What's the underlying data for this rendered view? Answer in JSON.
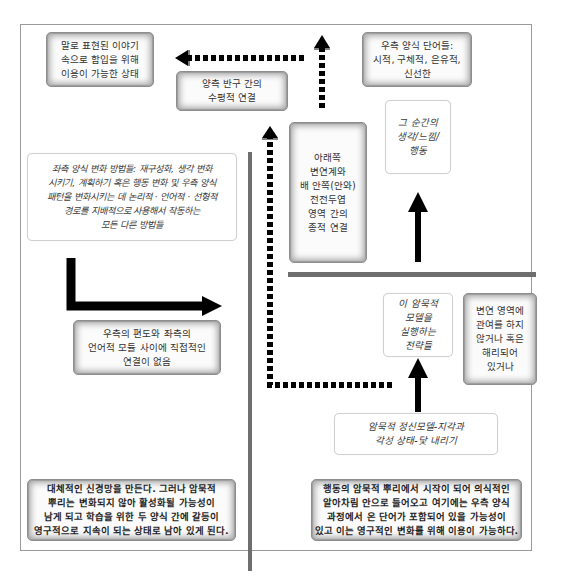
{
  "diagram": {
    "type": "brain-hemisphere-connection-diagram",
    "colors": {
      "frame_border": "#9a9a9a",
      "divider": "#6e6e6e",
      "arrow": "#000000",
      "shaded_box_edge": "#a8a8a8"
    },
    "boxes": {
      "verbal_story_state": {
        "text": "말로 표현된 이야기\n속으로 함입을 위해\n이용이 가능한 상태",
        "style": "shaded"
      },
      "horizontal_connection": {
        "text": "양측 반구 간의\n수평적 연결",
        "style": "shaded"
      },
      "right_mode_words": {
        "text": "우측 양식 단어들:\n시적, 구체적, 은유적,\n신선한",
        "style": "shaded"
      },
      "moment_thoughts": {
        "text": "그 순간의\n생각/느낌/\n행동",
        "style": "plain-italic"
      },
      "vertical_connection": {
        "text": "아래쪽\n변연계와\n배 안쪽(안와)\n전전두엽\n영역 간의\n종적 연결",
        "style": "shaded"
      },
      "left_mode_methods": {
        "text": "좌측 양식 변화 방법들: 재구성화, 생각 변화\n시키기, 계획하기 혹은 행동 변화 및 우측 양식\n패턴을 변화시키는 데 논리적 · 언어적 · 선형적\n경로를 지배적으로 사용해서 작동하는\n모든 다른 방법들",
        "style": "plain-italic"
      },
      "no_direct_connection": {
        "text": "우측의 편도와 좌측의\n언어적 모듈 사이에 직접적인\n연결이 없음",
        "style": "shaded"
      },
      "strategies": {
        "text": "이 암묵적\n모델을\n실행하는\n전략들",
        "style": "plain-italic"
      },
      "limbic_dissociated": {
        "text": "변연 영역에\n관여를 하지\n않거나 혹은\n해리되어\n있거나",
        "style": "shaded"
      },
      "implicit_mental_model": {
        "text": "암묵적 정신모델-지각과\n각성 상태-닻 내리기",
        "style": "plain-italic"
      },
      "alternative_network": {
        "text": "대체적인 신경망을 만든다. 그러나 암묵적\n뿌리는 변화되지 않아 활성화될 가능성이\n남게 되고 학습을 위한 두 양식 간에 갈등이\n영구적으로 지속이 되는 상태로 남아 있게 된다.",
        "style": "shaded-bold"
      },
      "implicit_roots_action": {
        "text": "행동의 암묵적 뿌리에서 시작이 되어 의식적인\n알아차림 안으로 들어오고 여기에는 우측 양식\n과정에서 온 단어가 포함되어 있을 가능성이\n있고 이는 영구적인 변화를 위해 이용이 가능하다.",
        "style": "shaded-bold"
      }
    },
    "connectors": [
      {
        "from": "left_mode_methods",
        "to": "no_direct_connection",
        "style": "solid-elbow"
      },
      {
        "from": "implicit_mental_model",
        "to": "strategies",
        "style": "solid"
      },
      {
        "from": "vertical_connection",
        "to": "moment_thoughts",
        "style": "solid"
      },
      {
        "from": "strategies",
        "to": "horizontal_connection-top",
        "style": "dashed-elbow"
      },
      {
        "from": "horizontal_connection-top",
        "to": "verbal_story_state",
        "style": "dashed"
      },
      {
        "from": "right_mode_words",
        "to": "top",
        "style": "dashed-vertical"
      }
    ]
  }
}
